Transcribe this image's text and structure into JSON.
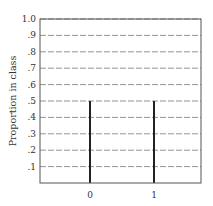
{
  "chart_data": {
    "type": "bar",
    "title": "",
    "xlabel": "",
    "ylabel": "Proportion in class",
    "categories": [
      "0",
      "1"
    ],
    "values": [
      0.5,
      0.5
    ],
    "ylim": [
      0,
      1.0
    ],
    "yticks": [
      ".1",
      ".2",
      ".3",
      ".4",
      ".5",
      ".6",
      ".7",
      ".8",
      ".9",
      "1.0"
    ],
    "ytick_values": [
      0.1,
      0.2,
      0.3,
      0.4,
      0.5,
      0.6,
      0.7,
      0.8,
      0.9,
      1.0
    ],
    "grid": "horizontal dashed",
    "legend": null,
    "bar_style": "thin vertical lines (spikes)"
  },
  "colors": {
    "frame": "#555555",
    "grid": "#777777",
    "bar": "#222222",
    "text": "#333333"
  }
}
